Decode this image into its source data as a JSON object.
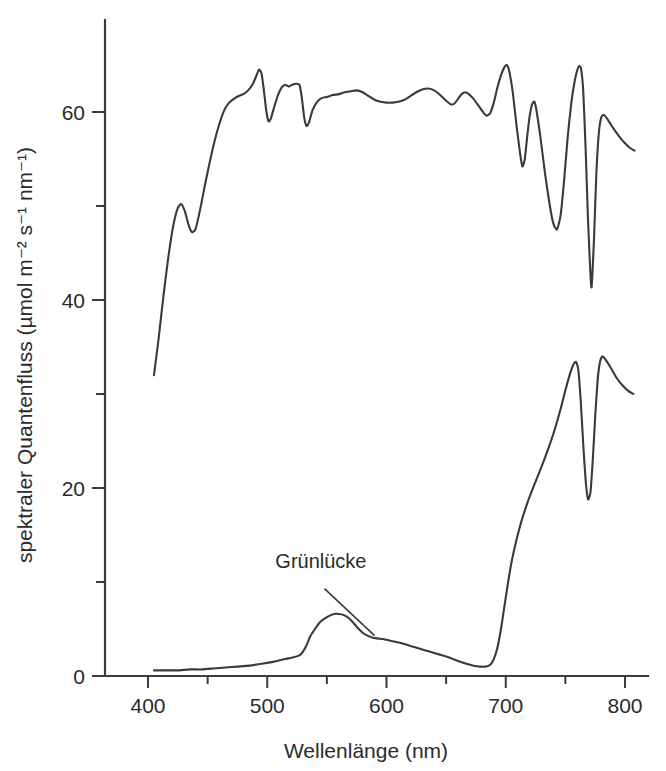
{
  "chart_data": {
    "type": "line",
    "title": "",
    "xlabel": "Wellenlänge (nm)",
    "ylabel": "spektraler Quantenfluss (µmol m⁻² s⁻¹ nm⁻¹)",
    "xlim": [
      360,
      815
    ],
    "ylim": [
      0,
      72
    ],
    "x_ticks_major": [
      400,
      500,
      600,
      700,
      800
    ],
    "x_ticks_major_labels": [
      "400",
      "500",
      "600",
      "700",
      "800"
    ],
    "x_ticks_minor": [
      450,
      550,
      650,
      750
    ],
    "y_ticks_major": [
      0,
      20,
      40,
      60
    ],
    "y_ticks_major_labels": [
      "0",
      "20",
      "40",
      "60"
    ],
    "y_ticks_minor": [
      10,
      30,
      50,
      70
    ],
    "grid": false,
    "legend": null,
    "line_color": "#3a3a3a",
    "background_color": "#ffffff",
    "annotations": [
      {
        "text": "Grünlücke",
        "text_x": 545,
        "text_y": 11.5,
        "leader_from_x": 548,
        "leader_from_y": 9.3,
        "leader_to_x": 590,
        "leader_to_y": 4.3
      }
    ],
    "series": [
      {
        "name": "Sonnenlicht (oben)",
        "points": [
          [
            405,
            32.0
          ],
          [
            409,
            36.0
          ],
          [
            413,
            40.5
          ],
          [
            417,
            44.5
          ],
          [
            421,
            47.8
          ],
          [
            425,
            49.8
          ],
          [
            428,
            50.2
          ],
          [
            431,
            49.4
          ],
          [
            434,
            48.0
          ],
          [
            437,
            47.2
          ],
          [
            440,
            47.6
          ],
          [
            444,
            49.8
          ],
          [
            448,
            52.4
          ],
          [
            452,
            54.8
          ],
          [
            456,
            57.0
          ],
          [
            460,
            58.8
          ],
          [
            464,
            60.2
          ],
          [
            468,
            61.0
          ],
          [
            472,
            61.4
          ],
          [
            476,
            61.7
          ],
          [
            480,
            61.9
          ],
          [
            484,
            62.3
          ],
          [
            488,
            63.0
          ],
          [
            491,
            63.9
          ],
          [
            493,
            64.5
          ],
          [
            495,
            64.2
          ],
          [
            497,
            62.5
          ],
          [
            499,
            60.3
          ],
          [
            501,
            59.0
          ],
          [
            503,
            59.3
          ],
          [
            506,
            60.6
          ],
          [
            509,
            61.8
          ],
          [
            512,
            62.6
          ],
          [
            515,
            62.9
          ],
          [
            518,
            62.7
          ],
          [
            521,
            62.9
          ],
          [
            524,
            63.0
          ],
          [
            527,
            62.9
          ],
          [
            529,
            61.5
          ],
          [
            531,
            59.4
          ],
          [
            533,
            58.5
          ],
          [
            535,
            58.9
          ],
          [
            538,
            60.2
          ],
          [
            542,
            61.1
          ],
          [
            546,
            61.5
          ],
          [
            550,
            61.6
          ],
          [
            555,
            61.8
          ],
          [
            560,
            61.9
          ],
          [
            565,
            62.1
          ],
          [
            570,
            62.2
          ],
          [
            575,
            62.3
          ],
          [
            580,
            62.1
          ],
          [
            585,
            61.7
          ],
          [
            590,
            61.3
          ],
          [
            595,
            61.1
          ],
          [
            600,
            61.0
          ],
          [
            605,
            61.0
          ],
          [
            610,
            61.1
          ],
          [
            615,
            61.3
          ],
          [
            620,
            61.7
          ],
          [
            625,
            62.1
          ],
          [
            630,
            62.4
          ],
          [
            635,
            62.5
          ],
          [
            640,
            62.3
          ],
          [
            645,
            61.8
          ],
          [
            650,
            61.2
          ],
          [
            654,
            60.8
          ],
          [
            657,
            60.9
          ],
          [
            660,
            61.4
          ],
          [
            663,
            61.9
          ],
          [
            666,
            62.1
          ],
          [
            669,
            61.9
          ],
          [
            673,
            61.4
          ],
          [
            677,
            60.7
          ],
          [
            681,
            60.0
          ],
          [
            684,
            59.6
          ],
          [
            687,
            59.9
          ],
          [
            690,
            61.0
          ],
          [
            693,
            62.6
          ],
          [
            696,
            63.9
          ],
          [
            699,
            64.8
          ],
          [
            701,
            65.0
          ],
          [
            703,
            64.3
          ],
          [
            706,
            62.0
          ],
          [
            709,
            58.6
          ],
          [
            712,
            55.6
          ],
          [
            714,
            54.2
          ],
          [
            716,
            55.0
          ],
          [
            718,
            57.4
          ],
          [
            720,
            59.5
          ],
          [
            722,
            60.8
          ],
          [
            724,
            61.1
          ],
          [
            726,
            60.0
          ],
          [
            729,
            57.4
          ],
          [
            733,
            53.4
          ],
          [
            737,
            50.0
          ],
          [
            740,
            48.1
          ],
          [
            743,
            47.5
          ],
          [
            746,
            49.0
          ],
          [
            749,
            52.8
          ],
          [
            752,
            57.4
          ],
          [
            755,
            61.0
          ],
          [
            758,
            63.4
          ],
          [
            761,
            64.8
          ],
          [
            763,
            64.7
          ],
          [
            765,
            62.2
          ],
          [
            767,
            56.0
          ],
          [
            769,
            48.5
          ],
          [
            771,
            42.8
          ],
          [
            772,
            41.4
          ],
          [
            774,
            46.5
          ],
          [
            776,
            53.5
          ],
          [
            778,
            57.7
          ],
          [
            780,
            59.4
          ],
          [
            782,
            59.7
          ],
          [
            785,
            59.3
          ],
          [
            789,
            58.5
          ],
          [
            794,
            57.6
          ],
          [
            799,
            56.8
          ],
          [
            804,
            56.2
          ],
          [
            808,
            55.9
          ]
        ]
      },
      {
        "name": "Licht unter Blattdach (unten)",
        "points": [
          [
            405,
            0.6
          ],
          [
            415,
            0.6
          ],
          [
            425,
            0.6
          ],
          [
            435,
            0.7
          ],
          [
            445,
            0.7
          ],
          [
            455,
            0.8
          ],
          [
            465,
            0.9
          ],
          [
            475,
            1.0
          ],
          [
            485,
            1.1
          ],
          [
            495,
            1.3
          ],
          [
            505,
            1.5
          ],
          [
            515,
            1.8
          ],
          [
            522,
            2.0
          ],
          [
            527,
            2.2
          ],
          [
            530,
            2.6
          ],
          [
            533,
            3.3
          ],
          [
            536,
            4.2
          ],
          [
            540,
            5.0
          ],
          [
            544,
            5.7
          ],
          [
            548,
            6.1
          ],
          [
            552,
            6.4
          ],
          [
            556,
            6.6
          ],
          [
            560,
            6.6
          ],
          [
            564,
            6.5
          ],
          [
            568,
            6.2
          ],
          [
            572,
            5.7
          ],
          [
            576,
            5.1
          ],
          [
            580,
            4.6
          ],
          [
            584,
            4.3
          ],
          [
            588,
            4.1
          ],
          [
            592,
            4.0
          ],
          [
            598,
            3.9
          ],
          [
            605,
            3.7
          ],
          [
            612,
            3.5
          ],
          [
            620,
            3.2
          ],
          [
            628,
            2.9
          ],
          [
            636,
            2.6
          ],
          [
            644,
            2.3
          ],
          [
            652,
            2.0
          ],
          [
            660,
            1.6
          ],
          [
            667,
            1.3
          ],
          [
            673,
            1.1
          ],
          [
            678,
            1.0
          ],
          [
            683,
            1.0
          ],
          [
            687,
            1.2
          ],
          [
            690,
            1.8
          ],
          [
            693,
            3.0
          ],
          [
            696,
            5.0
          ],
          [
            699,
            7.5
          ],
          [
            702,
            10.0
          ],
          [
            705,
            12.2
          ],
          [
            709,
            14.5
          ],
          [
            713,
            16.4
          ],
          [
            717,
            18.0
          ],
          [
            721,
            19.4
          ],
          [
            726,
            21.0
          ],
          [
            731,
            22.6
          ],
          [
            736,
            24.3
          ],
          [
            741,
            26.2
          ],
          [
            746,
            28.4
          ],
          [
            750,
            30.4
          ],
          [
            754,
            32.2
          ],
          [
            757,
            33.2
          ],
          [
            759,
            33.4
          ],
          [
            761,
            32.4
          ],
          [
            763,
            29.0
          ],
          [
            765,
            24.6
          ],
          [
            767,
            20.8
          ],
          [
            769,
            18.8
          ],
          [
            771,
            19.5
          ],
          [
            773,
            23.0
          ],
          [
            775,
            27.6
          ],
          [
            777,
            31.4
          ],
          [
            779,
            33.4
          ],
          [
            781,
            34.0
          ],
          [
            784,
            33.6
          ],
          [
            788,
            32.8
          ],
          [
            793,
            31.7
          ],
          [
            798,
            30.9
          ],
          [
            803,
            30.3
          ],
          [
            807,
            30.0
          ]
        ]
      }
    ]
  }
}
